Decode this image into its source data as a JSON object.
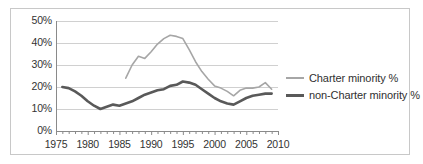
{
  "chart_data": {
    "type": "line",
    "title": "",
    "subtitle": "",
    "xlabel": "",
    "ylabel": "",
    "xlim": [
      1975,
      2010
    ],
    "ylim": [
      0,
      0.5
    ],
    "grid": true,
    "legend_position": "right",
    "y_tick_labels": [
      "50%",
      "40%",
      "30%",
      "20%",
      "10%",
      "0%"
    ],
    "y_tick_values": [
      0.5,
      0.4,
      0.3,
      0.2,
      0.1,
      0.0
    ],
    "x_tick_labels": [
      "1975",
      "1980",
      "1985",
      "1990",
      "1995",
      "2000",
      "2005",
      "2010"
    ],
    "x_tick_values": [
      1975,
      1980,
      1985,
      1990,
      1995,
      2000,
      2005,
      2010
    ],
    "x_minor_tick_interval": 1,
    "series": [
      {
        "name": "Charter minority %",
        "color": "#a6a6a6",
        "line_width": 1.6,
        "x": [
          1986,
          1987,
          1988,
          1989,
          1990,
          1991,
          1992,
          1993,
          1994,
          1995,
          1996,
          1997,
          1998,
          1999,
          2000,
          2001,
          2002,
          2003,
          2004,
          2005,
          2006,
          2007,
          2008,
          2009
        ],
        "values": [
          24.0,
          30.0,
          34.0,
          33.0,
          36.0,
          39.5,
          42.0,
          43.5,
          43.0,
          42.0,
          37.0,
          31.5,
          27.0,
          23.5,
          20.5,
          19.5,
          18.0,
          16.0,
          18.5,
          19.5,
          19.5,
          20.0,
          22.0,
          19.0
        ]
      },
      {
        "name": "non-Charter minority %",
        "color": "#595959",
        "line_width": 2.6,
        "x": [
          1976,
          1977,
          1978,
          1979,
          1980,
          1981,
          1982,
          1983,
          1984,
          1985,
          1986,
          1987,
          1988,
          1989,
          1990,
          1991,
          1992,
          1993,
          1994,
          1995,
          1996,
          1997,
          1998,
          1999,
          2000,
          2001,
          2002,
          2003,
          2004,
          2005,
          2006,
          2007,
          2008,
          2009
        ],
        "values": [
          20.0,
          19.5,
          18.0,
          16.0,
          13.5,
          11.5,
          10.0,
          11.0,
          12.0,
          11.5,
          12.5,
          13.5,
          15.0,
          16.5,
          17.5,
          18.5,
          19.0,
          20.5,
          21.0,
          22.5,
          22.0,
          21.0,
          19.0,
          17.0,
          15.0,
          13.5,
          12.5,
          12.0,
          13.5,
          15.0,
          16.0,
          16.5,
          17.0,
          17.0
        ]
      }
    ]
  },
  "legend": {
    "entries": [
      {
        "label": "Charter minority %",
        "marker": "line-swatch-light"
      },
      {
        "label": "non-Charter minority %",
        "marker": "line-swatch-dark"
      }
    ]
  },
  "colors": {
    "charter_line": "#a6a6a6",
    "non_charter_line": "#595959",
    "gridline": "#d0d0d0",
    "axis": "#8a8a8a",
    "frame": "#c8c8c8",
    "text": "#333333",
    "background": "#ffffff"
  }
}
